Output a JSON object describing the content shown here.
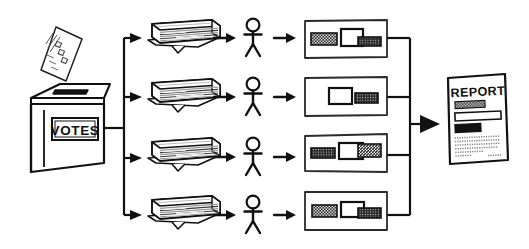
{
  "diagram": {
    "type": "flow-diagram",
    "style": "hand-drawn black ink on white",
    "colors": {
      "ink": "#111111",
      "background": "#ffffff",
      "fill_dark": "#1a1a1a",
      "fill_hatch": "#4a4a4a",
      "fill_light": "#ffffff",
      "paper_shade": "#d8d8d8"
    }
  },
  "source": {
    "name": "ballot-box",
    "label": "VOTES",
    "ballot": {
      "name": "ballot-paper",
      "marks": 4
    }
  },
  "branches": [
    {
      "index": 1,
      "stack": {
        "name": "paper-stack",
        "sheets": 6
      },
      "person": {
        "name": "counter-person"
      },
      "result": {
        "name": "tally-card",
        "items": [
          {
            "style": "hatched",
            "width": 34
          },
          {
            "style": "outline",
            "width": 30
          },
          {
            "style": "dark",
            "width": 30
          }
        ]
      }
    },
    {
      "index": 2,
      "stack": {
        "name": "paper-stack",
        "sheets": 6
      },
      "person": {
        "name": "counter-person"
      },
      "result": {
        "name": "tally-card",
        "items": [
          {
            "style": "outline",
            "width": 28
          },
          {
            "style": "dark",
            "width": 26
          }
        ]
      }
    },
    {
      "index": 3,
      "stack": {
        "name": "paper-stack",
        "sheets": 6
      },
      "person": {
        "name": "counter-person"
      },
      "result": {
        "name": "tally-card",
        "items": [
          {
            "style": "dark",
            "width": 30
          },
          {
            "style": "outline",
            "width": 30
          },
          {
            "style": "hatched",
            "width": 28
          }
        ]
      }
    },
    {
      "index": 4,
      "stack": {
        "name": "paper-stack",
        "sheets": 6
      },
      "person": {
        "name": "counter-person"
      },
      "result": {
        "name": "tally-card",
        "items": [
          {
            "style": "hatched",
            "width": 30
          },
          {
            "style": "outline",
            "width": 28
          },
          {
            "style": "dark",
            "width": 30
          }
        ]
      }
    }
  ],
  "output": {
    "name": "report-document",
    "title": "REPORT",
    "blocks": [
      {
        "style": "dark",
        "label": ""
      },
      {
        "style": "outline",
        "label": ""
      },
      {
        "style": "dark",
        "label": ""
      }
    ],
    "body_lines": 7,
    "footer_mark": ""
  },
  "connectors": {
    "fan_out": {
      "name": "fan-out-connector",
      "branches": 4
    },
    "fan_in": {
      "name": "fan-in-connector",
      "branches": 4
    },
    "arrows": {
      "name": "arrow-connector"
    }
  }
}
